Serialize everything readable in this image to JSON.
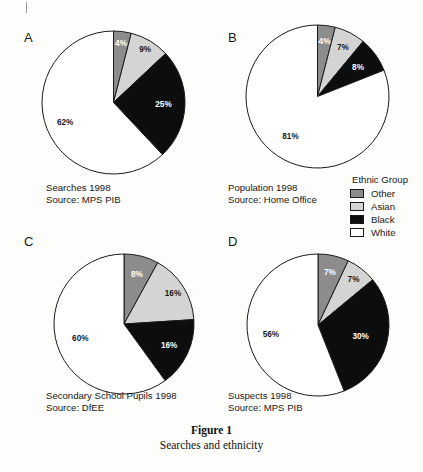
{
  "figure": {
    "title": "Figure 1",
    "subtitle": "Searches and ethnicity"
  },
  "legend": {
    "title": "Ethnic Group",
    "items": [
      {
        "label": "Other",
        "color": "#8c8c8c"
      },
      {
        "label": "Asian",
        "color": "#d4d4d4"
      },
      {
        "label": "Black",
        "color": "#0d0d0d"
      },
      {
        "label": "White",
        "color": "#ffffff"
      }
    ]
  },
  "panels": [
    {
      "letter": "A",
      "caption_line1": "Searches 1998",
      "caption_line2": "Source: MPS PIB"
    },
    {
      "letter": "B",
      "caption_line1": "Population 1998",
      "caption_line2": "Source: Home Office"
    },
    {
      "letter": "C",
      "caption_line1": "Secondary School Pupils 1998",
      "caption_line2": "Source: DfEE"
    },
    {
      "letter": "D",
      "caption_line1": "Suspects 1998",
      "caption_line2": "Source: MPS PIB"
    }
  ],
  "chart_data": [
    {
      "type": "pie",
      "panel": "A",
      "title": "Searches 1998",
      "source": "Source: MPS PIB",
      "categories": [
        "Other",
        "Asian",
        "Black",
        "White"
      ],
      "values": [
        4,
        9,
        25,
        62
      ],
      "labels": [
        "4%",
        "9%",
        "25%",
        "62%"
      ],
      "colors": [
        "#8c8c8c",
        "#d4d4d4",
        "#0d0d0d",
        "#ffffff"
      ],
      "start_angle_deg": 0,
      "direction": "clockwise",
      "units": "percent"
    },
    {
      "type": "pie",
      "panel": "B",
      "title": "Population 1998",
      "source": "Source: Home Office",
      "categories": [
        "Other",
        "Asian",
        "Black",
        "White"
      ],
      "values": [
        4,
        7,
        8,
        81
      ],
      "labels": [
        "4%",
        "7%",
        "8%",
        "81%"
      ],
      "colors": [
        "#8c8c8c",
        "#d4d4d4",
        "#0d0d0d",
        "#ffffff"
      ],
      "start_angle_deg": 0,
      "direction": "clockwise",
      "units": "percent"
    },
    {
      "type": "pie",
      "panel": "C",
      "title": "Secondary School Pupils 1998",
      "source": "Source: DfEE",
      "categories": [
        "Other",
        "Asian",
        "Black",
        "White"
      ],
      "values": [
        8,
        16,
        16,
        60
      ],
      "labels": [
        "8%",
        "16%",
        "16%",
        "60%"
      ],
      "colors": [
        "#8c8c8c",
        "#d4d4d4",
        "#0d0d0d",
        "#ffffff"
      ],
      "start_angle_deg": 0,
      "direction": "clockwise",
      "units": "percent"
    },
    {
      "type": "pie",
      "panel": "D",
      "title": "Suspects 1998",
      "source": "Source: MPS PIB",
      "categories": [
        "Other",
        "Asian",
        "Black",
        "White"
      ],
      "values": [
        7,
        7,
        30,
        56
      ],
      "labels": [
        "7%",
        "7%",
        "30%",
        "56%"
      ],
      "colors": [
        "#8c8c8c",
        "#d4d4d4",
        "#0d0d0d",
        "#ffffff"
      ],
      "start_angle_deg": 0,
      "direction": "clockwise",
      "units": "percent"
    }
  ]
}
